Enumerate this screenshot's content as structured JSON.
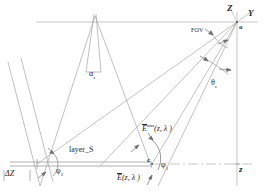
{
  "figure": {
    "background_color": "#ffffff",
    "line_color": "#9a9a9a",
    "text_color": "#2a2a2a",
    "width": 265,
    "height": 193
  },
  "labels": {
    "axis_z_up": "Z",
    "axis_y_right": "Y",
    "origin": "o",
    "axis_z_bottom": "z",
    "fov": "FOV",
    "theta": "θ",
    "theta_sub": "s",
    "alpha": "α",
    "alpha_sub": "s",
    "phi_right": "φ",
    "phi_right_sub": "1",
    "phi_left": "φ",
    "phi_left_sub": "2",
    "point_c": "c",
    "layer": "layer_S",
    "delta_z": "ΔZ",
    "e_max_base": "E",
    "e_max_sup": "max",
    "e_max_args": "(z, λ )",
    "e_base": "E",
    "e_args": "(z, λ )"
  },
  "geometry": {
    "origin_point": {
      "x": 237,
      "y": 22
    },
    "apex_point": {
      "x": 95,
      "y": 16
    },
    "c_point": {
      "x": 152,
      "y": 164
    },
    "layer_left_point": {
      "x": 37,
      "y": 164
    },
    "horizon_line_y": 22,
    "baseline_y": 164,
    "vertical_axis_x": 237
  }
}
